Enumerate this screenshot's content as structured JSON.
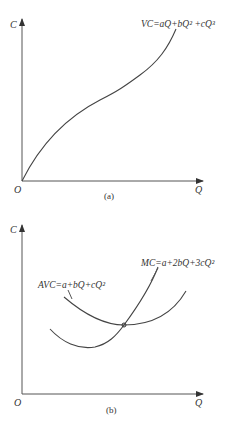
{
  "panels": [
    {
      "id": "a",
      "caption": "(a)",
      "y_axis_label": "C",
      "x_axis_label": "Q",
      "origin_label": "O",
      "curves": [
        {
          "name": "VC",
          "label": "VC=aQ+bQ² +cQ³",
          "shape": "cubic S-curve through origin"
        }
      ]
    },
    {
      "id": "b",
      "caption": "(b)",
      "y_axis_label": "C",
      "x_axis_label": "Q",
      "origin_label": "O",
      "curves": [
        {
          "name": "AVC",
          "label": "AVC=a+bQ+cQ²",
          "shape": "U-shaped"
        },
        {
          "name": "MC",
          "label": "MC=a+2bQ+3cQ²",
          "shape": "U-shaped, crosses AVC at its minimum"
        }
      ],
      "annotations": [
        "MC intersects AVC at AVC minimum"
      ]
    }
  ],
  "colors": {
    "line": "#444444",
    "background": "#ffffff"
  }
}
